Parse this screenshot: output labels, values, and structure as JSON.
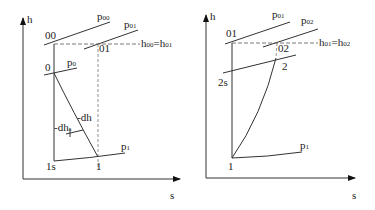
{
  "left_diagram": {
    "axes": {
      "y_label": "h",
      "x_label": "s"
    },
    "isobars": {
      "p00": {
        "base": "p",
        "sub": "00"
      },
      "p01": {
        "base": "p",
        "sub": "01"
      },
      "p0": {
        "base": "p",
        "sub": "0"
      },
      "p1": {
        "base": "p",
        "sub": "1"
      }
    },
    "points": {
      "pt_00": "00",
      "pt_01": "01",
      "pt_0": "0",
      "pt_1s": "1s",
      "pt_1": "1"
    },
    "enthalpy_eq": {
      "h1": "h",
      "s1": "00",
      "eq": "=h",
      "s2": "01"
    },
    "annotations": {
      "dhs": {
        "base": "-dh",
        "sub": "s"
      },
      "dh": "-dh"
    }
  },
  "right_diagram": {
    "axes": {
      "y_label": "h",
      "x_label": "s"
    },
    "isobars": {
      "p01": {
        "base": "p",
        "sub": "01"
      },
      "p02": {
        "base": "p",
        "sub": "02"
      },
      "p1": {
        "base": "p",
        "sub": "1"
      }
    },
    "points": {
      "pt_01": "01",
      "pt_02": "02",
      "pt_2": "2",
      "pt_2s": "2s",
      "pt_1": "1"
    },
    "enthalpy_eq": {
      "h1": "h",
      "s1": "01",
      "eq": "=h",
      "s2": "02"
    }
  }
}
